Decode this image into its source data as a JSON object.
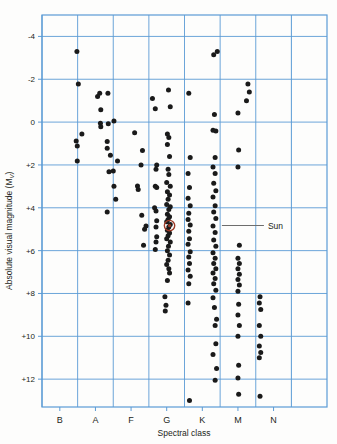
{
  "figure": {
    "kind": "hertzsprung-russell-diagram",
    "background": "#fdfdfc"
  },
  "axes": {
    "y_title": "Absolute visual magnitude (M",
    "y_title_sub": "V",
    "y_title_close": ")",
    "x_title": "Spectral class",
    "y_ticks": [
      "-4",
      "-2",
      "0",
      "+2",
      "+4",
      "+6",
      "+8",
      "+10",
      "+12"
    ],
    "x_ticks": [
      "B",
      "A",
      "F",
      "G",
      "K",
      "M",
      "N"
    ]
  },
  "annotations": [
    {
      "name": "sun-label",
      "text": "Sun",
      "x": 4.55,
      "y": 4.83
    }
  ],
  "colors": {
    "grid": "#5b9bd5",
    "frame": "#5b9bd5",
    "point": "#1a1a1a",
    "sun_marker": "#9c3a26",
    "text": "#231f20",
    "leader": "#6d6d6d"
  },
  "chart_data": {
    "type": "scatter",
    "title": "",
    "xlabel": "Spectral class",
    "ylabel": "Absolute visual magnitude (Mv)",
    "xlim": [
      -0.5,
      7.5
    ],
    "ylim": [
      13.3,
      -5.0
    ],
    "y_inverted": true,
    "grid": true,
    "legend": false,
    "x_categories": [
      "B",
      "A",
      "F",
      "G",
      "K",
      "M",
      "N"
    ],
    "y_tick_values": [
      -4,
      -2,
      0,
      2,
      4,
      6,
      8,
      10,
      12
    ],
    "series": [
      {
        "name": "Nearby and bright stars",
        "marker": "filled-circle",
        "color": "#1a1a1a",
        "points": [
          [
            0.48,
            -3.3
          ],
          [
            0.52,
            -1.78
          ],
          [
            0.46,
            0.88
          ],
          [
            0.49,
            1.12
          ],
          [
            0.62,
            0.55
          ],
          [
            0.49,
            1.82
          ],
          [
            1.12,
            -1.35
          ],
          [
            1.06,
            -1.2
          ],
          [
            1.35,
            -1.35
          ],
          [
            1.15,
            -0.58
          ],
          [
            1.36,
            0.08
          ],
          [
            1.14,
            0.05
          ],
          [
            1.15,
            0.22
          ],
          [
            1.52,
            -0.05
          ],
          [
            1.33,
            0.9
          ],
          [
            1.33,
            1.22
          ],
          [
            1.42,
            1.55
          ],
          [
            1.5,
            2.28
          ],
          [
            1.38,
            2.32
          ],
          [
            1.62,
            1.82
          ],
          [
            1.52,
            3.0
          ],
          [
            1.57,
            3.6
          ],
          [
            1.33,
            4.2
          ],
          [
            2.1,
            0.5
          ],
          [
            2.32,
            1.32
          ],
          [
            2.28,
            2.0
          ],
          [
            2.18,
            2.98
          ],
          [
            2.2,
            3.15
          ],
          [
            2.3,
            4.35
          ],
          [
            2.42,
            4.85
          ],
          [
            2.38,
            5.0
          ],
          [
            2.35,
            5.75
          ],
          [
            2.6,
            -1.1
          ],
          [
            2.68,
            -0.62
          ],
          [
            2.72,
            2.0
          ],
          [
            2.7,
            2.2
          ],
          [
            2.68,
            3.0
          ],
          [
            2.72,
            3.05
          ],
          [
            2.66,
            4.0
          ],
          [
            2.7,
            4.15
          ],
          [
            2.72,
            4.6
          ],
          [
            2.7,
            4.9
          ],
          [
            2.72,
            5.35
          ],
          [
            2.7,
            5.6
          ],
          [
            2.68,
            5.95
          ],
          [
            3.05,
            -1.5
          ],
          [
            3.1,
            -0.72
          ],
          [
            3.02,
            0.55
          ],
          [
            3.06,
            0.72
          ],
          [
            3.02,
            1.05
          ],
          [
            3.08,
            1.6
          ],
          [
            3.04,
            2.2
          ],
          [
            3.06,
            2.45
          ],
          [
            3.0,
            2.82
          ],
          [
            3.1,
            3.0
          ],
          [
            3.02,
            3.25
          ],
          [
            3.08,
            3.4
          ],
          [
            3.04,
            3.6
          ],
          [
            3.0,
            3.85
          ],
          [
            3.1,
            3.95
          ],
          [
            3.06,
            4.08
          ],
          [
            3.02,
            4.3
          ],
          [
            3.08,
            4.42
          ],
          [
            3.04,
            4.55
          ],
          [
            3.0,
            4.65
          ],
          [
            3.1,
            4.78
          ],
          [
            3.06,
            4.9
          ],
          [
            3.02,
            5.05
          ],
          [
            3.08,
            5.18
          ],
          [
            3.04,
            5.3
          ],
          [
            3.0,
            5.45
          ],
          [
            3.1,
            5.6
          ],
          [
            3.05,
            5.8
          ],
          [
            3.02,
            6.0
          ],
          [
            3.08,
            6.2
          ],
          [
            3.04,
            6.45
          ],
          [
            3.0,
            6.65
          ],
          [
            3.06,
            6.85
          ],
          [
            3.08,
            7.05
          ],
          [
            3.02,
            7.4
          ],
          [
            2.95,
            8.15
          ],
          [
            2.98,
            8.55
          ],
          [
            2.96,
            8.82
          ],
          [
            3.62,
            -1.35
          ],
          [
            3.66,
            1.65
          ],
          [
            3.6,
            2.4
          ],
          [
            3.64,
            3.05
          ],
          [
            3.6,
            3.55
          ],
          [
            3.66,
            3.9
          ],
          [
            3.62,
            4.25
          ],
          [
            3.6,
            4.55
          ],
          [
            3.66,
            4.8
          ],
          [
            3.62,
            5.1
          ],
          [
            3.64,
            5.45
          ],
          [
            3.6,
            5.7
          ],
          [
            3.66,
            6.05
          ],
          [
            3.62,
            6.3
          ],
          [
            3.64,
            6.6
          ],
          [
            3.6,
            6.9
          ],
          [
            3.66,
            7.2
          ],
          [
            3.62,
            7.55
          ],
          [
            3.6,
            8.45
          ],
          [
            3.64,
            13.0
          ],
          [
            4.32,
            -3.15
          ],
          [
            4.42,
            -3.3
          ],
          [
            4.34,
            -0.35
          ],
          [
            4.3,
            0.38
          ],
          [
            4.38,
            0.42
          ],
          [
            4.36,
            1.65
          ],
          [
            4.3,
            2.1
          ],
          [
            4.36,
            2.4
          ],
          [
            4.32,
            2.85
          ],
          [
            4.38,
            3.2
          ],
          [
            4.3,
            3.5
          ],
          [
            4.36,
            3.9
          ],
          [
            4.32,
            4.2
          ],
          [
            4.38,
            4.5
          ],
          [
            4.3,
            4.85
          ],
          [
            4.36,
            5.15
          ],
          [
            4.32,
            5.5
          ],
          [
            4.38,
            5.8
          ],
          [
            4.3,
            6.1
          ],
          [
            4.36,
            6.35
          ],
          [
            4.32,
            6.6
          ],
          [
            4.38,
            6.85
          ],
          [
            4.3,
            7.05
          ],
          [
            4.36,
            7.3
          ],
          [
            4.32,
            7.55
          ],
          [
            4.38,
            7.85
          ],
          [
            4.3,
            8.2
          ],
          [
            4.34,
            8.65
          ],
          [
            4.4,
            9.2
          ],
          [
            4.36,
            9.5
          ],
          [
            4.38,
            10.35
          ],
          [
            4.3,
            10.85
          ],
          [
            4.4,
            11.5
          ],
          [
            4.36,
            12.05
          ],
          [
            5.0,
            -0.42
          ],
          [
            5.02,
            1.3
          ],
          [
            5.0,
            2.1
          ],
          [
            5.04,
            5.75
          ],
          [
            5.0,
            6.35
          ],
          [
            5.04,
            6.6
          ],
          [
            5.0,
            6.85
          ],
          [
            5.04,
            7.1
          ],
          [
            5.0,
            7.35
          ],
          [
            5.04,
            7.6
          ],
          [
            5.0,
            7.9
          ],
          [
            5.02,
            8.5
          ],
          [
            5.0,
            9.0
          ],
          [
            5.04,
            9.5
          ],
          [
            5.0,
            10.0
          ],
          [
            5.02,
            11.35
          ],
          [
            5.0,
            11.95
          ],
          [
            5.02,
            12.7
          ],
          [
            5.28,
            -1.78
          ],
          [
            5.32,
            -1.4
          ],
          [
            5.24,
            -1.0
          ],
          [
            5.62,
            8.15
          ],
          [
            5.6,
            8.45
          ],
          [
            5.64,
            8.75
          ],
          [
            5.6,
            9.5
          ],
          [
            5.64,
            10.0
          ],
          [
            5.6,
            10.45
          ],
          [
            5.64,
            10.75
          ],
          [
            5.6,
            11.0
          ],
          [
            5.62,
            12.8
          ]
        ]
      },
      {
        "name": "Sun",
        "marker": "open-circle",
        "color": "#9c3a26",
        "points": [
          [
            3.08,
            4.83
          ]
        ]
      }
    ]
  }
}
